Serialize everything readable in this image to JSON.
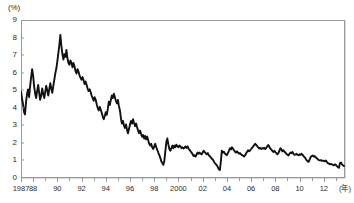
{
  "chart_data": {
    "type": "line",
    "title": "",
    "subtitle": "",
    "xlabel": "(年)",
    "ylabel": "(%)",
    "unit_label_y": "(%)",
    "unit_label_x": "(年)",
    "grid": false,
    "legend": "none",
    "xlim": [
      1987.0,
      2013.75
    ],
    "ylim": [
      0,
      9
    ],
    "y_ticks": [
      0,
      1,
      2,
      3,
      4,
      5,
      6,
      7,
      8,
      9
    ],
    "y_tick_labels": [
      "0",
      "1",
      "2",
      "3",
      "4",
      "5",
      "6",
      "7",
      "8",
      "9"
    ],
    "x_ticks": [
      1987.0,
      1988.0,
      1990.0,
      1992.0,
      1994.0,
      1996.0,
      1998.0,
      2000.0,
      2002.0,
      2004.0,
      2006.0,
      2008.0,
      2010.0,
      2012.0
    ],
    "x_tick_labels": [
      "1987",
      "88",
      "90",
      "92",
      "94",
      "96",
      "98",
      "2000",
      "02",
      "04",
      "06",
      "08",
      "10",
      "12"
    ],
    "series": [
      {
        "name": "long-term-interest-rate",
        "color": "#111111",
        "x": [
          1987.0,
          1987.08,
          1987.17,
          1987.25,
          1987.33,
          1987.42,
          1987.5,
          1987.58,
          1987.67,
          1987.75,
          1987.83,
          1987.92,
          1988.0,
          1988.08,
          1988.17,
          1988.25,
          1988.33,
          1988.42,
          1988.5,
          1988.58,
          1988.67,
          1988.75,
          1988.83,
          1988.92,
          1989.0,
          1989.08,
          1989.17,
          1989.25,
          1989.33,
          1989.42,
          1989.5,
          1989.58,
          1989.67,
          1989.75,
          1989.83,
          1989.92,
          1990.0,
          1990.08,
          1990.17,
          1990.25,
          1990.33,
          1990.42,
          1990.5,
          1990.58,
          1990.67,
          1990.75,
          1990.83,
          1990.92,
          1991.0,
          1991.08,
          1991.17,
          1991.25,
          1991.33,
          1991.42,
          1991.5,
          1991.58,
          1991.67,
          1991.75,
          1991.83,
          1991.92,
          1992.0,
          1992.08,
          1992.17,
          1992.25,
          1992.33,
          1992.42,
          1992.5,
          1992.58,
          1992.67,
          1992.75,
          1992.83,
          1992.92,
          1993.0,
          1993.08,
          1993.17,
          1993.25,
          1993.33,
          1993.42,
          1993.5,
          1993.58,
          1993.67,
          1993.75,
          1993.83,
          1993.92,
          1994.0,
          1994.08,
          1994.17,
          1994.25,
          1994.33,
          1994.42,
          1994.5,
          1994.58,
          1994.67,
          1994.75,
          1994.83,
          1994.92,
          1995.0,
          1995.08,
          1995.17,
          1995.25,
          1995.33,
          1995.42,
          1995.5,
          1995.58,
          1995.67,
          1995.75,
          1995.83,
          1995.92,
          1996.0,
          1996.08,
          1996.17,
          1996.25,
          1996.33,
          1996.42,
          1996.5,
          1996.58,
          1996.67,
          1996.75,
          1996.83,
          1996.92,
          1997.0,
          1997.08,
          1997.17,
          1997.25,
          1997.33,
          1997.42,
          1997.5,
          1997.58,
          1997.67,
          1997.75,
          1997.83,
          1997.92,
          1998.0,
          1998.08,
          1998.17,
          1998.25,
          1998.33,
          1998.42,
          1998.5,
          1998.58,
          1998.67,
          1998.75,
          1998.83,
          1998.92,
          1999.0,
          1999.08,
          1999.17,
          1999.25,
          1999.33,
          1999.42,
          1999.5,
          1999.58,
          1999.67,
          1999.75,
          1999.83,
          1999.92,
          2000.0,
          2000.08,
          2000.17,
          2000.25,
          2000.33,
          2000.42,
          2000.5,
          2000.58,
          2000.67,
          2000.75,
          2000.83,
          2000.92,
          2001.0,
          2001.08,
          2001.17,
          2001.25,
          2001.33,
          2001.42,
          2001.5,
          2001.58,
          2001.67,
          2001.75,
          2001.83,
          2001.92,
          2002.0,
          2002.08,
          2002.17,
          2002.25,
          2002.33,
          2002.42,
          2002.5,
          2002.58,
          2002.67,
          2002.75,
          2002.83,
          2002.92,
          2003.0,
          2003.08,
          2003.17,
          2003.25,
          2003.33,
          2003.42,
          2003.5,
          2003.58,
          2003.67,
          2003.75,
          2003.83,
          2003.92,
          2004.0,
          2004.08,
          2004.17,
          2004.25,
          2004.33,
          2004.42,
          2004.5,
          2004.58,
          2004.67,
          2004.75,
          2004.83,
          2004.92,
          2005.0,
          2005.08,
          2005.17,
          2005.25,
          2005.33,
          2005.42,
          2005.5,
          2005.58,
          2005.67,
          2005.75,
          2005.83,
          2005.92,
          2006.0,
          2006.08,
          2006.17,
          2006.25,
          2006.33,
          2006.42,
          2006.5,
          2006.58,
          2006.67,
          2006.75,
          2006.83,
          2006.92,
          2007.0,
          2007.08,
          2007.17,
          2007.25,
          2007.33,
          2007.42,
          2007.5,
          2007.58,
          2007.67,
          2007.75,
          2007.83,
          2007.92,
          2008.0,
          2008.08,
          2008.17,
          2008.25,
          2008.33,
          2008.42,
          2008.5,
          2008.58,
          2008.67,
          2008.75,
          2008.83,
          2008.92,
          2009.0,
          2009.08,
          2009.17,
          2009.25,
          2009.33,
          2009.42,
          2009.5,
          2009.58,
          2009.67,
          2009.75,
          2009.83,
          2009.92,
          2010.0,
          2010.08,
          2010.17,
          2010.25,
          2010.33,
          2010.42,
          2010.5,
          2010.58,
          2010.67,
          2010.75,
          2010.83,
          2010.92,
          2011.0,
          2011.08,
          2011.17,
          2011.25,
          2011.33,
          2011.42,
          2011.5,
          2011.58,
          2011.67,
          2011.75,
          2011.83,
          2011.92,
          2012.0,
          2012.08,
          2012.17,
          2012.25,
          2012.33,
          2012.42,
          2012.5,
          2012.58,
          2012.67,
          2012.75,
          2012.83,
          2012.92,
          2013.0,
          2013.08,
          2013.17,
          2013.25,
          2013.33,
          2013.42,
          2013.5,
          2013.58,
          2013.67
        ],
        "y": [
          4.95,
          4.55,
          4.2,
          3.75,
          3.62,
          4.35,
          4.8,
          5.05,
          4.6,
          5.2,
          5.7,
          6.2,
          5.85,
          5.25,
          4.8,
          4.55,
          4.95,
          5.3,
          4.85,
          4.45,
          4.7,
          5.1,
          4.8,
          4.55,
          4.9,
          5.25,
          5.0,
          4.7,
          5.05,
          5.4,
          5.1,
          4.85,
          5.25,
          5.6,
          5.95,
          6.25,
          6.65,
          7.1,
          7.6,
          8.15,
          7.55,
          7.05,
          6.75,
          7.05,
          6.9,
          7.3,
          6.85,
          6.55,
          6.45,
          6.7,
          6.55,
          6.3,
          6.55,
          6.35,
          6.1,
          5.95,
          6.2,
          6.05,
          5.85,
          5.7,
          5.6,
          5.75,
          5.55,
          5.35,
          5.5,
          5.3,
          5.1,
          4.95,
          5.05,
          4.9,
          4.7,
          4.55,
          4.4,
          4.6,
          4.45,
          4.2,
          4.0,
          3.85,
          4.05,
          3.9,
          3.7,
          3.5,
          3.35,
          3.55,
          3.75,
          3.6,
          3.95,
          4.35,
          4.15,
          4.45,
          4.7,
          4.55,
          4.8,
          4.6,
          4.4,
          4.25,
          4.45,
          4.1,
          3.85,
          3.4,
          3.1,
          3.25,
          3.0,
          2.85,
          3.05,
          2.75,
          2.55,
          2.8,
          3.05,
          3.25,
          3.1,
          3.35,
          3.15,
          2.95,
          3.1,
          2.9,
          2.7,
          2.55,
          2.7,
          2.5,
          2.35,
          2.45,
          2.25,
          2.4,
          2.2,
          2.35,
          2.15,
          1.95,
          1.85,
          1.95,
          1.75,
          1.65,
          1.8,
          1.95,
          1.75,
          1.6,
          1.45,
          1.3,
          1.15,
          0.95,
          0.85,
          0.75,
          0.95,
          1.55,
          2.05,
          2.25,
          1.9,
          1.65,
          1.55,
          1.7,
          1.85,
          1.7,
          1.85,
          1.75,
          1.9,
          1.8,
          1.75,
          1.85,
          1.8,
          1.7,
          1.75,
          1.68,
          1.72,
          1.8,
          1.72,
          1.8,
          1.68,
          1.6,
          1.52,
          1.45,
          1.35,
          1.25,
          1.3,
          1.22,
          1.35,
          1.45,
          1.38,
          1.45,
          1.38,
          1.35,
          1.45,
          1.55,
          1.48,
          1.4,
          1.35,
          1.42,
          1.3,
          1.25,
          1.18,
          1.1,
          1.05,
          0.95,
          0.85,
          0.8,
          0.72,
          0.62,
          0.5,
          0.45,
          0.95,
          1.55,
          1.45,
          1.5,
          1.4,
          1.35,
          1.3,
          1.42,
          1.55,
          1.7,
          1.62,
          1.75,
          1.68,
          1.58,
          1.5,
          1.45,
          1.52,
          1.45,
          1.38,
          1.42,
          1.35,
          1.3,
          1.28,
          1.22,
          1.3,
          1.4,
          1.5,
          1.58,
          1.52,
          1.58,
          1.65,
          1.72,
          1.8,
          1.88,
          1.95,
          1.88,
          1.82,
          1.75,
          1.68,
          1.72,
          1.65,
          1.7,
          1.68,
          1.72,
          1.65,
          1.72,
          1.8,
          1.88,
          1.78,
          1.68,
          1.62,
          1.55,
          1.48,
          1.55,
          1.48,
          1.42,
          1.35,
          1.42,
          1.55,
          1.7,
          1.62,
          1.52,
          1.58,
          1.5,
          1.45,
          1.38,
          1.32,
          1.28,
          1.38,
          1.45,
          1.42,
          1.48,
          1.38,
          1.32,
          1.35,
          1.38,
          1.32,
          1.3,
          1.35,
          1.32,
          1.38,
          1.32,
          1.25,
          1.18,
          1.1,
          1.02,
          0.95,
          0.92,
          1.05,
          1.2,
          1.25,
          1.28,
          1.22,
          1.25,
          1.18,
          1.12,
          1.08,
          1.02,
          1.0,
          1.02,
          0.98,
          0.98,
          0.98,
          0.95,
          1.0,
          0.92,
          0.85,
          0.82,
          0.78,
          0.8,
          0.78,
          0.75,
          0.72,
          0.78,
          0.75,
          0.68,
          0.62,
          0.58,
          0.85,
          0.88,
          0.78,
          0.72,
          0.68
        ]
      }
    ],
    "annotations": {
      "peak_value": 8.15,
      "peak_year": 1990.25,
      "trough_value": 0.45,
      "trough_year": 2003.42,
      "start_value": 4.95,
      "end_value": 0.68
    }
  },
  "colors": {
    "series": "#111111",
    "frame": "#9a9a9a",
    "text": "#2b2b2b",
    "background": "#ffffff"
  }
}
